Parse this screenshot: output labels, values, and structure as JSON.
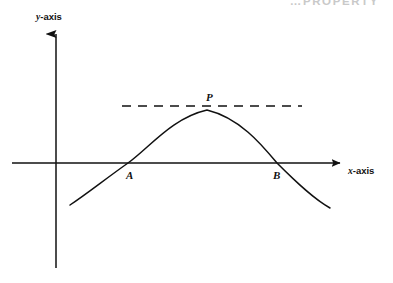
{
  "header": {
    "watermark_text": "…PROPERTY"
  },
  "figure": {
    "axes": {
      "y_axis_label": "y-axis",
      "x_axis_label": "x-axis",
      "axis_label_italic_prefix_y": "y",
      "axis_label_suffix_y": "-axis",
      "axis_label_italic_prefix_x": "x",
      "axis_label_suffix_x": "-axis"
    },
    "points": {
      "a": "A",
      "b": "B",
      "p": "P"
    },
    "colors": {
      "ink": "#111111",
      "watermark": "#c9c9c9",
      "background": "#ffffff"
    }
  },
  "chart_data": {
    "type": "line",
    "title": "",
    "xlabel": "x-axis",
    "ylabel": "y-axis",
    "grid": false,
    "legend": null,
    "origin_px": [
      56,
      163
    ],
    "x_axis_px": {
      "start": 12,
      "end": 344,
      "y": 163,
      "arrow": "right"
    },
    "y_axis_px": {
      "top": 30,
      "bottom": 268,
      "x": 56,
      "arrow": "up"
    },
    "series": [
      {
        "name": "cubic-like curve",
        "points_px": [
          [
            70,
            205
          ],
          [
            92,
            191
          ],
          [
            110,
            178
          ],
          [
            128,
            163
          ],
          [
            148,
            143
          ],
          [
            168,
            126
          ],
          [
            188,
            114
          ],
          [
            207,
            110
          ],
          [
            226,
            114
          ],
          [
            245,
            126
          ],
          [
            262,
            145
          ],
          [
            277,
            163
          ],
          [
            295,
            183
          ],
          [
            312,
            197
          ],
          [
            330,
            208
          ]
        ]
      }
    ],
    "annotations": [
      {
        "label": "A",
        "type": "x-intercept",
        "at_px": [
          128,
          163
        ],
        "label_px": [
          131,
          180
        ]
      },
      {
        "label": "B",
        "type": "x-intercept",
        "at_px": [
          277,
          163
        ],
        "label_px": [
          277,
          180
        ]
      },
      {
        "label": "P",
        "type": "local-maximum",
        "at_px": [
          207,
          110
        ],
        "label_px": [
          211,
          100
        ]
      }
    ],
    "tangent_line": {
      "style": "dashed",
      "y_px": 106,
      "x_start_px": 122,
      "x_end_px": 302,
      "dash_pattern": "9 7"
    }
  }
}
